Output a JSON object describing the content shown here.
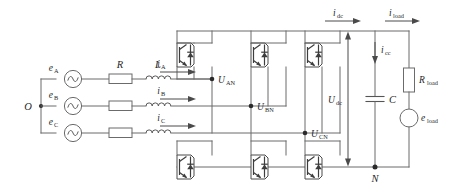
{
  "diagram": {
    "type": "circuit-schematic",
    "background_color": "#ffffff",
    "wire_color": "#6b6b6b",
    "label_color": "#1f1f1f"
  },
  "ac_side": {
    "neutral_node_label": "O",
    "sources": [
      {
        "id": "source-a",
        "label": "e",
        "subscript": "A",
        "symbol": "ac-source-sine"
      },
      {
        "id": "source-b",
        "label": "e",
        "subscript": "B",
        "symbol": "ac-source-sine"
      },
      {
        "id": "source-c",
        "label": "e",
        "subscript": "C",
        "symbol": "ac-source-sine"
      }
    ],
    "resistor_label": "R",
    "inductor_label": "L",
    "currents": [
      {
        "id": "current-a",
        "label": "i",
        "subscript": "A",
        "direction": "right"
      },
      {
        "id": "current-b",
        "label": "i",
        "subscript": "B",
        "direction": "right"
      },
      {
        "id": "current-c",
        "label": "i",
        "subscript": "C",
        "direction": "right"
      }
    ]
  },
  "converter": {
    "legs": 3,
    "switch_symbol": "igbt-with-antiparallel-diode",
    "pole_voltages": [
      {
        "id": "pole-a",
        "label": "U",
        "subscript": "AN"
      },
      {
        "id": "pole-b",
        "label": "U",
        "subscript": "BN"
      },
      {
        "id": "pole-c",
        "label": "U",
        "subscript": "CN"
      }
    ]
  },
  "dc_side": {
    "dc_current": {
      "label": "i",
      "subscript": "dc",
      "direction": "right"
    },
    "cap_current": {
      "label": "i",
      "subscript": "cc",
      "direction": "down"
    },
    "load_current": {
      "label": "i",
      "subscript": "load",
      "direction": "right"
    },
    "dc_voltage": {
      "label": "U",
      "subscript": "dc"
    },
    "capacitor_label": "C",
    "negative_rail_node_label": "N"
  },
  "load": {
    "resistor": {
      "label": "R",
      "subscript": "load",
      "symbol": "resistor-box"
    },
    "source": {
      "label": "e",
      "subscript": "load",
      "symbol": "dc-source-circle"
    }
  }
}
